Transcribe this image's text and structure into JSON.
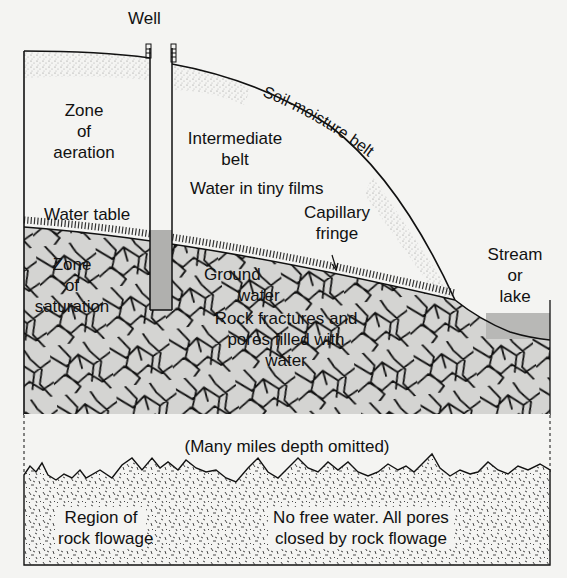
{
  "diagram": {
    "type": "groundwater-cross-section",
    "labels": {
      "well": "Well",
      "zone_of_aeration": [
        "Zone",
        "of",
        "aeration"
      ],
      "soil_moisture_belt": "Soil-moisture belt",
      "intermediate_belt": [
        "Intermediate",
        "belt"
      ],
      "water_in_tiny_films": "Water in tiny films",
      "water_table": "Water table",
      "capillary_fringe": [
        "Capillary",
        "fringe"
      ],
      "zone_of_saturation": [
        "Zone",
        "of",
        "saturation"
      ],
      "ground_water": [
        "Ground",
        "water"
      ],
      "rock_fractures": [
        "Rock fractures and",
        "pores filled with",
        "water"
      ],
      "stream_or_lake": [
        "Stream",
        "or",
        "lake"
      ],
      "depth_omitted": "(Many miles depth omitted)",
      "region_rock_flowage": [
        "Region of",
        "rock flowage"
      ],
      "no_free_water": [
        "No free water. All pores",
        "closed by rock flowage"
      ]
    },
    "colors": {
      "ink": "#111111",
      "paper": "#f4f4f2",
      "saturated_fill": "#d4d4d2",
      "water_fill": "#b8b8b6",
      "stipple": "#9a9a98"
    }
  }
}
